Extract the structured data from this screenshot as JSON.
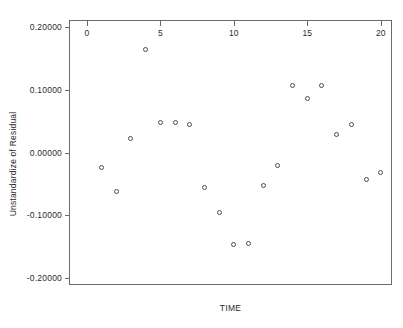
{
  "chart_data": {
    "type": "scatter",
    "title": "",
    "xlabel": "TIME",
    "ylabel": "Unstandardize of Residual",
    "xlim": [
      -1.15,
      20.7
    ],
    "ylim": [
      -0.21,
      0.21
    ],
    "grid": false,
    "legend": null,
    "xticks": [
      "0",
      "5",
      "10",
      "15",
      "20"
    ],
    "xtick_values": [
      0,
      5,
      10,
      15,
      20
    ],
    "yticks": [
      "0.20000",
      "0.10000",
      "0.00000",
      "-0.10000",
      "-0.20000"
    ],
    "ytick_values": [
      0.2,
      0.1,
      0.0,
      -0.1,
      -0.2
    ],
    "marker": "open-circle",
    "marker_color": "#4a4a4a",
    "x": [
      1,
      2,
      3,
      4,
      5,
      6,
      7,
      8,
      9,
      10,
      11,
      12,
      13,
      14,
      15,
      16,
      17,
      18,
      19,
      20
    ],
    "y": [
      -0.02459,
      -0.0623,
      0.02213,
      0.16393,
      0.04754,
      0.04754,
      0.04426,
      -0.05574,
      -0.09508,
      -0.14754,
      -0.1459,
      -0.05246,
      -0.02131,
      0.10656,
      0.08689,
      0.10656,
      0.02951,
      0.04426,
      -0.04262,
      -0.03115
    ],
    "points": [
      {
        "x": 1,
        "y": -0.02459
      },
      {
        "x": 2,
        "y": -0.0623
      },
      {
        "x": 3,
        "y": 0.02213
      },
      {
        "x": 4,
        "y": 0.16393
      },
      {
        "x": 5,
        "y": 0.04754
      },
      {
        "x": 6,
        "y": 0.04754
      },
      {
        "x": 7,
        "y": 0.04426
      },
      {
        "x": 8,
        "y": -0.05574
      },
      {
        "x": 9,
        "y": -0.09508
      },
      {
        "x": 10,
        "y": -0.14754
      },
      {
        "x": 11,
        "y": -0.1459
      },
      {
        "x": 12,
        "y": -0.05246
      },
      {
        "x": 13,
        "y": -0.02131
      },
      {
        "x": 14,
        "y": 0.10656
      },
      {
        "x": 15,
        "y": 0.08689
      },
      {
        "x": 16,
        "y": 0.10656
      },
      {
        "x": 17,
        "y": 0.02951
      },
      {
        "x": 18,
        "y": 0.04426
      },
      {
        "x": 19,
        "y": -0.04262
      },
      {
        "x": 20,
        "y": -0.03115
      }
    ]
  }
}
